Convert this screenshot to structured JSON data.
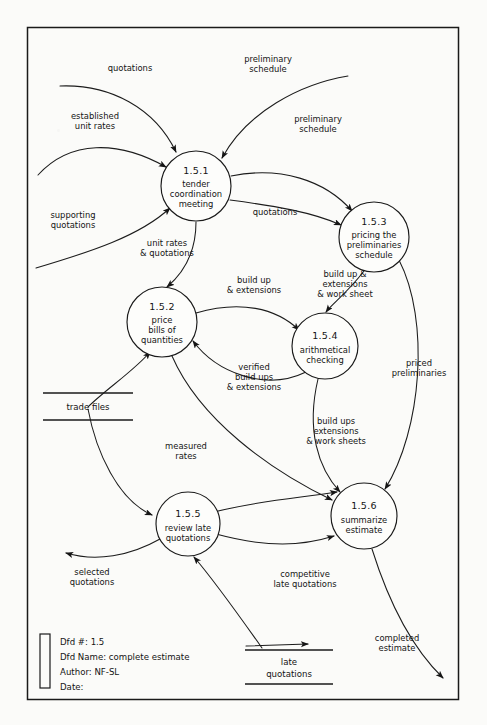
{
  "diagram": {
    "frame": {
      "x": 27,
      "y": 27,
      "width": 432,
      "height": 673
    }
  },
  "title_block": {
    "lines": [
      "Dfd #: 1.5",
      "Dfd Name: complete estimate",
      "Author: NF-SL",
      "Date:"
    ],
    "dfd_number": "1.5",
    "dfd_name": "complete estimate",
    "author": "NF-SL",
    "date": ""
  },
  "processes": [
    {
      "id": "1.5.1",
      "name_lines": [
        "tender",
        "coordination",
        "meeting"
      ],
      "cx": 196,
      "cy": 186,
      "r": 35
    },
    {
      "id": "1.5.3",
      "name_lines": [
        "pricing the",
        "preliminaries",
        "schedule"
      ],
      "cx": 374,
      "cy": 237,
      "r": 35
    },
    {
      "id": "1.5.2",
      "name_lines": [
        "price",
        "bills of",
        "quantities"
      ],
      "cx": 162,
      "cy": 322,
      "r": 35
    },
    {
      "id": "1.5.4",
      "name_lines": [
        "arithmetical",
        "checking"
      ],
      "cx": 325,
      "cy": 346,
      "r": 33
    },
    {
      "id": "1.5.5",
      "name_lines": [
        "review late",
        "quotations"
      ],
      "cx": 188,
      "cy": 524,
      "r": 32
    },
    {
      "id": "1.5.6",
      "name_lines": [
        "summarize",
        "estimate"
      ],
      "cx": 364,
      "cy": 516,
      "r": 33
    }
  ],
  "data_stores": [
    {
      "label_lines": [
        "trade files"
      ],
      "x": 43,
      "y": 393,
      "width": 90
    },
    {
      "label_lines": [
        "late",
        "quotations"
      ],
      "x": 245,
      "y": 650,
      "width": 88
    }
  ],
  "flows": [
    {
      "label_lines": [
        "quotations"
      ],
      "lx": 130,
      "ly": 68
    },
    {
      "label_lines": [
        "preliminary",
        "schedule"
      ],
      "lx": 268,
      "ly": 63
    },
    {
      "label_lines": [
        "established",
        "unit rates"
      ],
      "lx": 95,
      "ly": 119
    },
    {
      "label_lines": [
        "preliminary",
        "schedule"
      ],
      "lx": 318,
      "ly": 122
    },
    {
      "label_lines": [
        "supporting",
        "quotations"
      ],
      "lx": 73,
      "ly": 218
    },
    {
      "label_lines": [
        "quotations"
      ],
      "lx": 275,
      "ly": 215
    },
    {
      "label_lines": [
        "unit rates",
        "& quotations"
      ],
      "lx": 167,
      "ly": 246
    },
    {
      "label_lines": [
        "build up",
        "& extensions"
      ],
      "lx": 254,
      "ly": 283
    },
    {
      "label_lines": [
        "build up &",
        "extensions",
        "& work sheet"
      ],
      "lx": 345,
      "ly": 277
    },
    {
      "label_lines": [
        "priced",
        "preliminaries"
      ],
      "lx": 419,
      "ly": 366
    },
    {
      "label_lines": [
        "verified",
        "build ups",
        "& extensions"
      ],
      "lx": 254,
      "ly": 370
    },
    {
      "label_lines": [
        "build ups",
        "extensions",
        "& work sheets"
      ],
      "lx": 336,
      "ly": 424
    },
    {
      "label_lines": [
        "measured",
        "rates"
      ],
      "lx": 186,
      "ly": 449
    },
    {
      "label_lines": [
        "selected",
        "quotations"
      ],
      "lx": 92,
      "ly": 575
    },
    {
      "label_lines": [
        "competitive",
        "late quotations"
      ],
      "lx": 305,
      "ly": 577
    },
    {
      "label_lines": [
        "completed",
        "estimate"
      ],
      "lx": 397,
      "ly": 641
    }
  ],
  "colors": {
    "ink": "#1a1a1a",
    "paper": "#fbfbf9",
    "node_fill": "#fdfdfb"
  }
}
